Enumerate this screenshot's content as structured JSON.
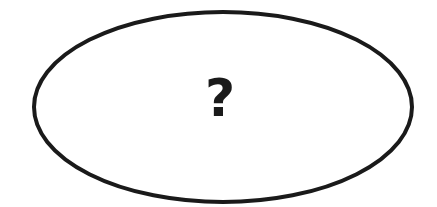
{
  "diagram": {
    "shape": "ellipse",
    "stroke_color": "#1a1a1a",
    "fill_color": "#ffffff",
    "label": "?"
  }
}
